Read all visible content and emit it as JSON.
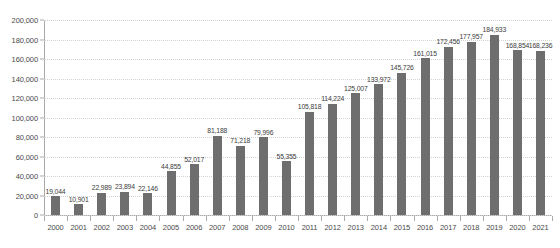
{
  "chart_data": {
    "type": "bar",
    "title": "",
    "subtitle": "",
    "xlabel": "",
    "ylabel": "",
    "ylim": [
      0,
      200000
    ],
    "yticks": [
      "0",
      "20,000",
      "40,000",
      "60,000",
      "80,000",
      "100,000",
      "120,000",
      "140,000",
      "160,000",
      "180,000",
      "200,000"
    ],
    "ytick_values": [
      0,
      20000,
      40000,
      60000,
      80000,
      100000,
      120000,
      140000,
      160000,
      180000,
      200000
    ],
    "grid": true,
    "legend": false,
    "bar_color": "#6e6e6e",
    "grid_color": "#d2d2d2",
    "axis_color": "#aaaaaa",
    "categories": [
      "2000",
      "2001",
      "2002",
      "2003",
      "2004",
      "2005",
      "2006",
      "2007",
      "2008",
      "2009",
      "2010",
      "2011",
      "2012",
      "2013",
      "2014",
      "2015",
      "2016",
      "2017",
      "2018",
      "2019",
      "2020",
      "2021"
    ],
    "values": [
      19044,
      10901,
      22989,
      23894,
      22146,
      44855,
      52017,
      81188,
      71218,
      79996,
      55355,
      105818,
      114224,
      125007,
      133972,
      145726,
      161015,
      172456,
      177957,
      184933,
      168854,
      168236
    ],
    "value_labels": [
      "19,044",
      "10,901",
      "22,989",
      "23,894",
      "22,146",
      "44,855",
      "52,017",
      "81,188",
      "71,218",
      "79,996",
      "55,355",
      "105,818",
      "114,224",
      "125,007",
      "133,972",
      "145,726",
      "161,015",
      "172,456",
      "177,957",
      "184,933",
      "168,854",
      "168,236"
    ]
  }
}
